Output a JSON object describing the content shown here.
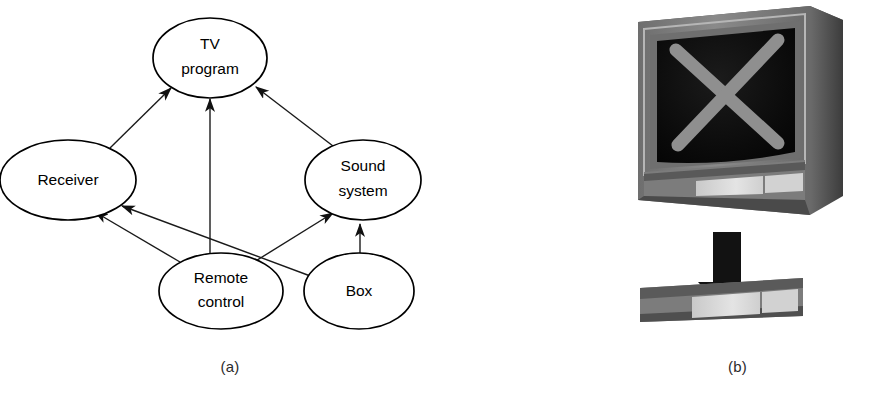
{
  "figure": {
    "panel_a": {
      "caption": "(a)",
      "type": "directed-graph",
      "nodes": [
        {
          "id": "tv-program",
          "label_line1": "TV",
          "label_line2": "program",
          "cx": 210,
          "cy": 58,
          "rx": 57,
          "ry": 40
        },
        {
          "id": "receiver",
          "label_line1": "Receiver",
          "label_line2": "",
          "cx": 68,
          "cy": 180,
          "rx": 68,
          "ry": 40
        },
        {
          "id": "sound-system",
          "label_line1": "Sound",
          "label_line2": "system",
          "cx": 363,
          "cy": 180,
          "rx": 58,
          "ry": 40
        },
        {
          "id": "remote-control",
          "label_line1": "Remote",
          "label_line2": "control",
          "cx": 221,
          "cy": 291,
          "rx": 62,
          "ry": 38
        },
        {
          "id": "box",
          "label_line1": "Box",
          "label_line2": "",
          "cx": 359,
          "cy": 291,
          "rx": 55,
          "ry": 38
        }
      ],
      "edges": [
        {
          "from": "receiver",
          "to": "tv-program",
          "x1": 110,
          "y1": 148,
          "x2": 171,
          "y2": 88
        },
        {
          "from": "remote-control",
          "to": "tv-program",
          "x1": 210,
          "y1": 253,
          "x2": 210,
          "y2": 99
        },
        {
          "from": "sound-system",
          "to": "tv-program",
          "x1": 333,
          "y1": 146,
          "x2": 256,
          "y2": 87
        },
        {
          "from": "remote-control",
          "to": "receiver",
          "x1": 180,
          "y1": 262,
          "x2": 95,
          "y2": 212
        },
        {
          "from": "box",
          "to": "receiver",
          "x1": 313,
          "y1": 277,
          "x2": 120,
          "y2": 205
        },
        {
          "from": "remote-control",
          "to": "sound-system",
          "x1": 246,
          "y1": 267,
          "x2": 333,
          "y2": 213
        },
        {
          "from": "box",
          "to": "sound-system",
          "x1": 360,
          "y1": 253,
          "x2": 360,
          "y2": 222
        }
      ]
    },
    "panel_b": {
      "caption": "(b)",
      "type": "illustration",
      "description_parts": [
        "television-set",
        "crossed-out-screen",
        "down-arrow",
        "detached-control-panel"
      ],
      "colors": {
        "screen": "#0d0d0d",
        "cabinet_front": "#7a7a7a",
        "cabinet_side": "#4f4f4f",
        "cabinet_top": "#5e5e5e",
        "bezel_light": "#a8a8a8",
        "bezel_dark": "#585858",
        "x_mark": "#8c8c8c",
        "panel_light": "#d9d9d9",
        "panel_mid": "#b4b4b4",
        "arrow": "#111111"
      }
    }
  }
}
